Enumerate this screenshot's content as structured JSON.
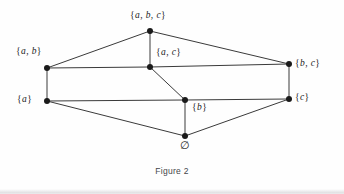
{
  "figure": {
    "caption": "Figure 2",
    "type": "hasse-diagram",
    "colors": {
      "background": "#fefefe",
      "edge": "#3a3a3a",
      "node": "#1a1a1a",
      "label": "#222222",
      "caption": "#44464a"
    },
    "nodes": [
      {
        "id": "abc",
        "label": "{a, b, c}",
        "x": 150,
        "y": 31,
        "label_x": 148,
        "label_y": 10,
        "label_anchor": "center"
      },
      {
        "id": "ab",
        "label": "{a, b}",
        "x": 47,
        "y": 68,
        "label_x": 16,
        "label_y": 46,
        "label_anchor": "left"
      },
      {
        "id": "ac",
        "label": "{a, c}",
        "x": 150,
        "y": 67,
        "label_x": 156,
        "label_y": 47,
        "label_anchor": "left"
      },
      {
        "id": "bc",
        "label": "{b, c}",
        "x": 289,
        "y": 64,
        "label_x": 295,
        "label_y": 58,
        "label_anchor": "left"
      },
      {
        "id": "a",
        "label": "{a}",
        "x": 47,
        "y": 101,
        "label_x": 17,
        "label_y": 94,
        "label_anchor": "left"
      },
      {
        "id": "b",
        "label": "{b}",
        "x": 185,
        "y": 100,
        "label_x": 192,
        "label_y": 102,
        "label_anchor": "left"
      },
      {
        "id": "c",
        "label": "{c}",
        "x": 289,
        "y": 99,
        "label_x": 295,
        "label_y": 92,
        "label_anchor": "left"
      },
      {
        "id": "empty",
        "label": "∅",
        "x": 185,
        "y": 136,
        "label_x": 180,
        "label_y": 140,
        "label_anchor": "left"
      }
    ],
    "edges": [
      {
        "from": "ab",
        "to": "abc"
      },
      {
        "from": "bc",
        "to": "abc"
      },
      {
        "from": "ac",
        "to": "abc"
      },
      {
        "from": "ab",
        "to": "ac"
      },
      {
        "from": "ac",
        "to": "bc"
      },
      {
        "from": "ab",
        "to": "a"
      },
      {
        "from": "bc",
        "to": "c"
      },
      {
        "from": "b",
        "to": "ac"
      },
      {
        "from": "a",
        "to": "b"
      },
      {
        "from": "b",
        "to": "c"
      },
      {
        "from": "a",
        "to": "empty"
      },
      {
        "from": "c",
        "to": "empty"
      },
      {
        "from": "empty",
        "to": "b"
      }
    ]
  }
}
